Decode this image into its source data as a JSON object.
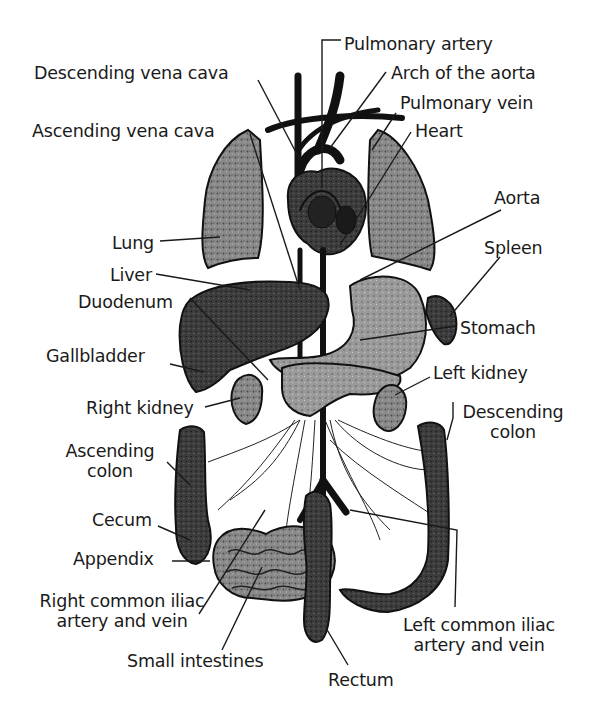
{
  "diagram": {
    "colors": {
      "background": "#ffffff",
      "ink": "#111111",
      "lung_fill": "#7a7a7a",
      "liver_fill": "#3a3a3a",
      "stomach_fill": "#8c8c8c",
      "kidney_fill": "#8a8a8a",
      "intestine_fill": "#6e6e6e",
      "colon_fill": "#4a4a4a"
    },
    "labels": [
      {
        "id": "pulmonary-artery",
        "text": "Pulmonary artery",
        "x": 344,
        "y": 34,
        "anchor": "left"
      },
      {
        "id": "descending-vena-cava",
        "text": "Descending vena cava",
        "x": 34,
        "y": 63,
        "anchor": "left"
      },
      {
        "id": "arch-of-the-aorta",
        "text": "Arch of the aorta",
        "x": 391,
        "y": 63,
        "anchor": "left"
      },
      {
        "id": "pulmonary-vein",
        "text": "Pulmonary vein",
        "x": 400,
        "y": 93,
        "anchor": "left"
      },
      {
        "id": "ascending-vena-cava",
        "text": "Ascending vena cava",
        "x": 32,
        "y": 121,
        "anchor": "left"
      },
      {
        "id": "heart",
        "text": "Heart",
        "x": 415,
        "y": 121,
        "anchor": "left"
      },
      {
        "id": "aorta",
        "text": "Aorta",
        "x": 494,
        "y": 188,
        "anchor": "left"
      },
      {
        "id": "lung",
        "text": "Lung",
        "x": 112,
        "y": 233,
        "anchor": "left"
      },
      {
        "id": "spleen",
        "text": "Spleen",
        "x": 484,
        "y": 238,
        "anchor": "left"
      },
      {
        "id": "liver",
        "text": "Liver",
        "x": 110,
        "y": 265,
        "anchor": "left"
      },
      {
        "id": "duodenum",
        "text": "Duodenum",
        "x": 78,
        "y": 292,
        "anchor": "left"
      },
      {
        "id": "stomach",
        "text": "Stomach",
        "x": 460,
        "y": 318,
        "anchor": "left"
      },
      {
        "id": "gallbladder",
        "text": "Gallbladder",
        "x": 46,
        "y": 346,
        "anchor": "left"
      },
      {
        "id": "left-kidney",
        "text": "Left kidney",
        "x": 433,
        "y": 363,
        "anchor": "left"
      },
      {
        "id": "right-kidney",
        "text": "Right kidney",
        "x": 86,
        "y": 398,
        "anchor": "left"
      },
      {
        "id": "descending-colon",
        "text": "Descending\ncolon",
        "x": 513,
        "y": 402,
        "anchor": "center"
      },
      {
        "id": "ascending-colon",
        "text": "Ascending\ncolon",
        "x": 110,
        "y": 441,
        "anchor": "center"
      },
      {
        "id": "cecum",
        "text": "Cecum",
        "x": 92,
        "y": 510,
        "anchor": "left"
      },
      {
        "id": "appendix",
        "text": "Appendix",
        "x": 73,
        "y": 549,
        "anchor": "left"
      },
      {
        "id": "right-common-iliac",
        "text": "Right common iliac\nartery and vein",
        "x": 122,
        "y": 591,
        "anchor": "center"
      },
      {
        "id": "left-common-iliac",
        "text": "Left common iliac\nartery and vein",
        "x": 479,
        "y": 615,
        "anchor": "center"
      },
      {
        "id": "small-intestines",
        "text": "Small intestines",
        "x": 127,
        "y": 651,
        "anchor": "left"
      },
      {
        "id": "rectum",
        "text": "Rectum",
        "x": 328,
        "y": 670,
        "anchor": "left"
      }
    ],
    "leaders": [
      {
        "id": "pulmonary-artery",
        "points": "341,40 322,40 322,188"
      },
      {
        "id": "descending-vena-cava",
        "points": "258,80 300,160"
      },
      {
        "id": "arch-of-the-aorta",
        "points": "386,72 330,148"
      },
      {
        "id": "pulmonary-vein",
        "points": "396,113 372,150"
      },
      {
        "id": "ascending-vena-cava",
        "points": "250,134 300,290"
      },
      {
        "id": "heart",
        "points": "411,132 340,245"
      },
      {
        "id": "aorta",
        "points": "501,210 360,280"
      },
      {
        "id": "lung",
        "points": "160,241 220,237"
      },
      {
        "id": "spleen",
        "points": "500,257 450,316"
      },
      {
        "id": "liver",
        "points": "156,274 250,290"
      },
      {
        "id": "duodenum",
        "points": "190,298 268,380"
      },
      {
        "id": "stomach",
        "points": "456,326 360,340"
      },
      {
        "id": "gallbladder",
        "points": "170,364 204,372"
      },
      {
        "id": "left-kidney",
        "points": "430,377 395,395"
      },
      {
        "id": "right-kidney",
        "points": "205,407 240,398"
      },
      {
        "id": "descending-colon",
        "points": "453,402 453,418 447,440"
      },
      {
        "id": "ascending-colon",
        "points": "167,462 190,485"
      },
      {
        "id": "cecum",
        "points": "158,526 190,540"
      },
      {
        "id": "appendix",
        "points": "172,561 210,561"
      },
      {
        "id": "right-common-iliac",
        "points": "199,614 265,510"
      },
      {
        "id": "left-common-iliac",
        "points": "455,607 457,530 350,510"
      },
      {
        "id": "small-intestines",
        "points": "222,650 262,567"
      },
      {
        "id": "rectum",
        "points": "348,665 326,628"
      }
    ]
  }
}
